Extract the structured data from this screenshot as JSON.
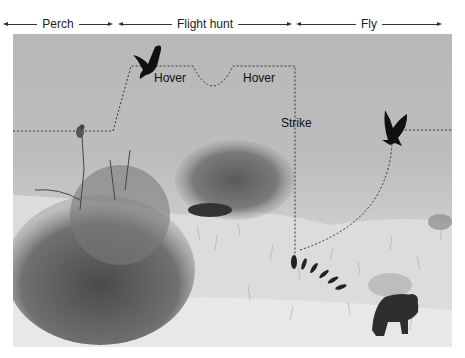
{
  "phases": [
    {
      "label": "Perch",
      "start_x": 3,
      "end_x": 113
    },
    {
      "label": "Flight hunt",
      "start_x": 118,
      "end_x": 292
    },
    {
      "label": "Fly",
      "start_x": 296,
      "end_x": 442
    }
  ],
  "annotations": {
    "hover_1": "Hover",
    "hover_2": "Hover",
    "strike": "Strike"
  },
  "scene": {
    "subjects": [
      "perched-kestrel",
      "hovering-kestrel",
      "flying-kestrel-with-prey",
      "striking-kestrel",
      "baboon",
      "acacia-shrub",
      "distant-bush",
      "grassland"
    ],
    "style": "grayscale-photo-with-dotted-flight-path"
  },
  "colors": {
    "sky": "#bdbdbd",
    "grass": "#e2e2e2",
    "path": "#333333",
    "bird": "#111111",
    "text": "#111111"
  }
}
